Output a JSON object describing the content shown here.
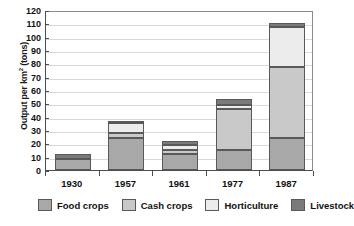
{
  "chart_data": {
    "type": "bar",
    "stacked": true,
    "title": "",
    "xlabel": "",
    "ylabel": "Output per km² (tons)",
    "ylabel_plain": "Output per km2 (tons)",
    "categories": [
      "1930",
      "1957",
      "1961",
      "1977",
      "1987"
    ],
    "series": [
      {
        "name": "Food crops",
        "color": "#a8a8a8",
        "values": [
          8,
          24,
          12,
          15,
          24
        ]
      },
      {
        "name": "Cash crops",
        "color": "#c9c9c9",
        "values": [
          0,
          4,
          3,
          31,
          53
        ]
      },
      {
        "name": "Horticulture",
        "color": "#ececec",
        "values": [
          0,
          7,
          4,
          3,
          30
        ]
      },
      {
        "name": "Livestock",
        "color": "#7a7a7a",
        "values": [
          4,
          2,
          3,
          4,
          3
        ]
      }
    ],
    "totals": [
      12,
      37,
      22,
      53,
      110
    ],
    "ylim": [
      0,
      120
    ],
    "y_ticks": [
      0,
      10,
      20,
      30,
      40,
      50,
      60,
      70,
      80,
      90,
      100,
      110,
      120
    ],
    "grid": true,
    "legend_position": "bottom"
  },
  "legend": {
    "items": [
      {
        "label": "Food crops",
        "swatch_name": "legend-swatch-food-crops"
      },
      {
        "label": "Cash crops",
        "swatch_name": "legend-swatch-cash-crops"
      },
      {
        "label": "Horticulture",
        "swatch_name": "legend-swatch-horticulture"
      },
      {
        "label": "Livestock",
        "swatch_name": "legend-swatch-livestock"
      }
    ]
  },
  "colors": {
    "food_crops": "#a8a8a8",
    "cash_crops": "#c9c9c9",
    "horticulture": "#ececec",
    "livestock": "#7a7a7a",
    "axis": "#4d4d4d",
    "grid": "#d9d9d9",
    "text": "#111111",
    "background": "#ffffff"
  }
}
